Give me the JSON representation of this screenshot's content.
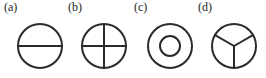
{
  "figure": {
    "background_color": "#ffffff",
    "stroke_color": "#2b2b2b",
    "stroke_width": 2,
    "panel_count": 4,
    "panels": [
      {
        "key": "a",
        "label": "(a)",
        "shape_name": "circle-bisected-horizontal",
        "description": "Circle divided by a single horizontal diameter into two half-disc regions",
        "regions": 2,
        "outer_radius": 22,
        "center_x": 40,
        "center_y": 29,
        "divider_count": 1,
        "divider_angles_deg": [
          0
        ],
        "inner_circle": false
      },
      {
        "key": "b",
        "label": "(b)",
        "shape_name": "circle-quartered-cross",
        "description": "Circle divided by horizontal and vertical diameters into four quadrant regions",
        "regions": 4,
        "outer_radius": 22,
        "center_x": 40,
        "center_y": 29,
        "divider_count": 2,
        "divider_angles_deg": [
          0,
          90
        ],
        "inner_circle": false
      },
      {
        "key": "c",
        "label": "(c)",
        "shape_name": "circle-concentric-annulus",
        "description": "Circle containing a smaller concentric circle forming an annulus and a central disc",
        "regions": 2,
        "outer_radius": 22,
        "inner_radius": 10,
        "center_x": 40,
        "center_y": 29,
        "divider_count": 0,
        "divider_angles_deg": [],
        "inner_circle": true
      },
      {
        "key": "d",
        "label": "(d)",
        "shape_name": "circle-trisected-three-sectors",
        "description": "Circle divided by three radii spaced 120 degrees apart into three equal sectors",
        "regions": 3,
        "outer_radius": 22,
        "center_x": 40,
        "center_y": 29,
        "divider_count": 3,
        "divider_angles_deg": [
          90,
          210,
          330
        ],
        "inner_circle": false
      }
    ]
  }
}
